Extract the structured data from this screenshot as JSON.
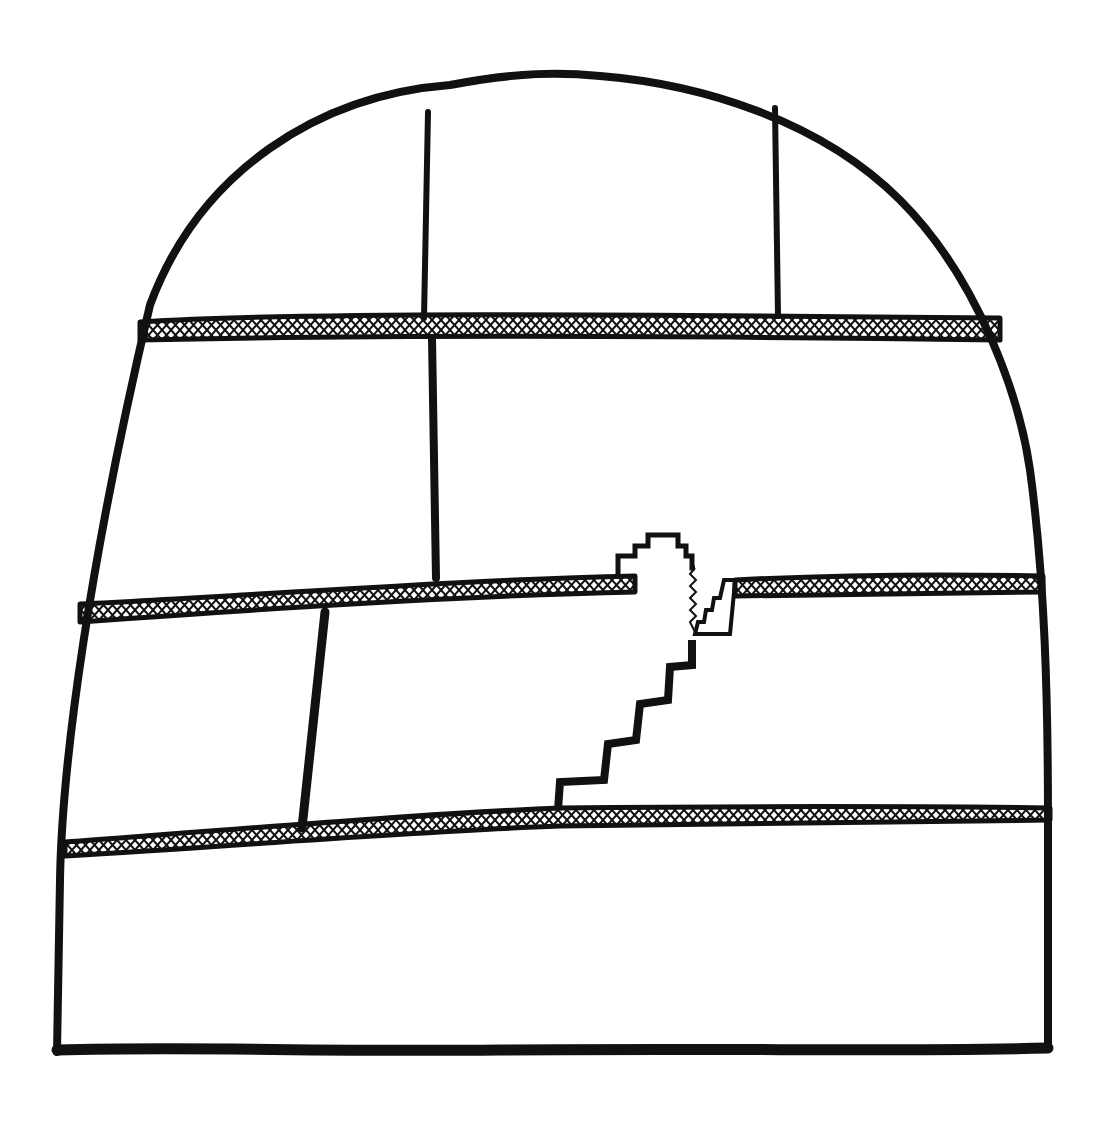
{
  "figure": {
    "type": "hand-drawn line illustration",
    "colors": {
      "ink": "#111111",
      "paper": "#ffffff"
    },
    "elements": {
      "outline": "arched-outline",
      "bands": [
        "upper-band",
        "middle-band",
        "lower-band"
      ],
      "joints": [
        "top-left-joint",
        "top-right-joint",
        "middle-joint",
        "lower-joint"
      ],
      "fracture": "stepped-fracture"
    }
  }
}
